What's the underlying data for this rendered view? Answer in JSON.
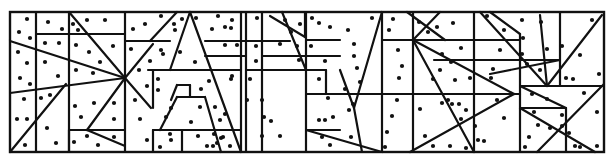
{
  "diagram": {
    "type": "polygon-dot-puzzle",
    "width": 614,
    "height": 162,
    "frame": {
      "x": 10,
      "y": 12,
      "w": 594,
      "h": 140
    },
    "colors": {
      "line": "#111111",
      "dot": "#111111",
      "background": "#ffffff"
    },
    "lines": [
      [
        36,
        12,
        36,
        152
      ],
      [
        69,
        12,
        69,
        152
      ],
      [
        125,
        12,
        125,
        152
      ],
      [
        10,
        40,
        10,
        40
      ],
      [
        36,
        34,
        125,
        34
      ],
      [
        10,
        41,
        125,
        78
      ],
      [
        10,
        93,
        125,
        78
      ],
      [
        10,
        152,
        66,
        84
      ],
      [
        69,
        130,
        125,
        130
      ],
      [
        87,
        130,
        125,
        146
      ],
      [
        87,
        130,
        125,
        78
      ],
      [
        69,
        12,
        125,
        78
      ],
      [
        125,
        78,
        153,
        44
      ],
      [
        125,
        78,
        151,
        108
      ],
      [
        125,
        41,
        170,
        41
      ],
      [
        150,
        41,
        177,
        12
      ],
      [
        148,
        70,
        205,
        70
      ],
      [
        153,
        70,
        153,
        108
      ],
      [
        170,
        70,
        190,
        12
      ],
      [
        190,
        12,
        241,
        152
      ],
      [
        171,
        100,
        177,
        85
      ],
      [
        177,
        85,
        190,
        85
      ],
      [
        190,
        85,
        190,
        97
      ],
      [
        177,
        97,
        205,
        97
      ],
      [
        160,
        130,
        177,
        97
      ],
      [
        205,
        97,
        221,
        152
      ],
      [
        153,
        130,
        241,
        130
      ],
      [
        153,
        130,
        153,
        152
      ],
      [
        182,
        130,
        182,
        152
      ],
      [
        69,
        130,
        69,
        152
      ],
      [
        241,
        12,
        241,
        152
      ],
      [
        246,
        12,
        246,
        152
      ],
      [
        205,
        41,
        290,
        41
      ],
      [
        205,
        56,
        246,
        56
      ],
      [
        205,
        70,
        241,
        70
      ],
      [
        246,
        70,
        290,
        70
      ],
      [
        262,
        12,
        262,
        152
      ],
      [
        262,
        56,
        306,
        56
      ],
      [
        270,
        16,
        305,
        37
      ],
      [
        305,
        37,
        305,
        12
      ],
      [
        282,
        12,
        306,
        70
      ],
      [
        306,
        40,
        340,
        40
      ],
      [
        306,
        56,
        340,
        56
      ],
      [
        306,
        12,
        306,
        152
      ],
      [
        290,
        70,
        326,
        70
      ],
      [
        326,
        70,
        326,
        94
      ],
      [
        306,
        94,
        382,
        94
      ],
      [
        340,
        70,
        354,
        108
      ],
      [
        354,
        108,
        382,
        12
      ],
      [
        306,
        130,
        340,
        130
      ],
      [
        306,
        130,
        382,
        152
      ],
      [
        354,
        108,
        362,
        152
      ],
      [
        340,
        152,
        340,
        152
      ],
      [
        382,
        12,
        382,
        152
      ],
      [
        382,
        40,
        413,
        40
      ],
      [
        382,
        94,
        413,
        94
      ],
      [
        407,
        12,
        445,
        40
      ],
      [
        413,
        12,
        413,
        152
      ],
      [
        413,
        40,
        520,
        40
      ],
      [
        440,
        12,
        413,
        40
      ],
      [
        413,
        40,
        474,
        152
      ],
      [
        413,
        40,
        514,
        94
      ],
      [
        434,
        60,
        520,
        60
      ],
      [
        413,
        94,
        520,
        94
      ],
      [
        514,
        94,
        520,
        94
      ],
      [
        410,
        152,
        514,
        94
      ],
      [
        474,
        12,
        474,
        152
      ],
      [
        490,
        12,
        520,
        34
      ],
      [
        520,
        34,
        520,
        152
      ],
      [
        480,
        12,
        547,
        86
      ],
      [
        540,
        15,
        547,
        86
      ],
      [
        560,
        12,
        560,
        86
      ],
      [
        547,
        86,
        602,
        15
      ],
      [
        520,
        60,
        560,
        60
      ],
      [
        490,
        74,
        560,
        60
      ],
      [
        520,
        86,
        604,
        86
      ],
      [
        520,
        86,
        566,
        108
      ],
      [
        520,
        108,
        566,
        108
      ],
      [
        520,
        108,
        595,
        152
      ],
      [
        566,
        108,
        566,
        152
      ],
      [
        537,
        152,
        604,
        84
      ]
    ],
    "dots": [
      [
        27,
        19
      ],
      [
        19,
        32
      ],
      [
        30,
        38
      ],
      [
        48,
        22
      ],
      [
        62,
        29
      ],
      [
        73,
        24
      ],
      [
        78,
        30
      ],
      [
        87,
        20
      ],
      [
        105,
        20
      ],
      [
        18,
        52
      ],
      [
        27,
        63
      ],
      [
        45,
        43
      ],
      [
        59,
        43
      ],
      [
        45,
        62
      ],
      [
        76,
        45
      ],
      [
        89,
        52
      ],
      [
        113,
        46
      ],
      [
        100,
        62
      ],
      [
        20,
        78
      ],
      [
        30,
        84
      ],
      [
        58,
        76
      ],
      [
        76,
        70
      ],
      [
        93,
        73
      ],
      [
        24,
        99
      ],
      [
        41,
        98
      ],
      [
        50,
        95
      ],
      [
        17,
        119
      ],
      [
        27,
        119
      ],
      [
        47,
        128
      ],
      [
        75,
        106
      ],
      [
        94,
        103
      ],
      [
        114,
        103
      ],
      [
        81,
        117
      ],
      [
        114,
        119
      ],
      [
        74,
        142
      ],
      [
        56,
        143
      ],
      [
        25,
        145
      ],
      [
        87,
        136
      ],
      [
        98,
        145
      ],
      [
        114,
        137
      ],
      [
        133,
        29
      ],
      [
        145,
        24
      ],
      [
        161,
        16
      ],
      [
        174,
        24
      ],
      [
        182,
        19
      ],
      [
        175,
        30
      ],
      [
        131,
        49
      ],
      [
        161,
        50
      ],
      [
        196,
        18
      ],
      [
        212,
        29
      ],
      [
        225,
        27
      ],
      [
        232,
        20
      ],
      [
        195,
        62
      ],
      [
        150,
        61
      ],
      [
        163,
        54
      ],
      [
        180,
        52
      ],
      [
        139,
        70
      ],
      [
        147,
        86
      ],
      [
        158,
        90
      ],
      [
        158,
        79
      ],
      [
        135,
        100
      ],
      [
        171,
        108
      ],
      [
        140,
        119
      ],
      [
        166,
        117
      ],
      [
        171,
        140
      ],
      [
        170,
        134
      ],
      [
        147,
        140
      ],
      [
        160,
        147
      ],
      [
        213,
        146
      ],
      [
        198,
        136
      ],
      [
        207,
        146
      ],
      [
        200,
        107
      ],
      [
        201,
        89
      ],
      [
        209,
        81
      ],
      [
        215,
        107
      ],
      [
        220,
        120
      ],
      [
        191,
        122
      ],
      [
        221,
        138
      ],
      [
        217,
        143
      ],
      [
        230,
        146
      ],
      [
        223,
        137
      ],
      [
        225,
        114
      ],
      [
        214,
        134
      ],
      [
        218,
        16
      ],
      [
        231,
        28
      ],
      [
        225,
        45
      ],
      [
        237,
        45
      ],
      [
        256,
        46
      ],
      [
        257,
        18
      ],
      [
        250,
        79
      ],
      [
        256,
        61
      ],
      [
        232,
        76
      ],
      [
        231,
        79
      ],
      [
        247,
        100
      ],
      [
        262,
        100
      ],
      [
        264,
        117
      ],
      [
        262,
        136
      ],
      [
        280,
        136
      ],
      [
        271,
        121
      ],
      [
        285,
        20
      ],
      [
        300,
        24
      ],
      [
        291,
        32
      ],
      [
        297,
        46
      ],
      [
        280,
        44
      ],
      [
        299,
        60
      ],
      [
        312,
        18
      ],
      [
        311,
        46
      ],
      [
        325,
        61
      ],
      [
        319,
        79
      ],
      [
        328,
        98
      ],
      [
        319,
        120
      ],
      [
        325,
        120
      ],
      [
        333,
        117
      ],
      [
        322,
        137
      ],
      [
        330,
        145
      ],
      [
        351,
        137
      ],
      [
        349,
        110
      ],
      [
        353,
        104
      ],
      [
        345,
        89
      ],
      [
        360,
        82
      ],
      [
        357,
        68
      ],
      [
        354,
        56
      ],
      [
        354,
        44
      ],
      [
        348,
        30
      ],
      [
        330,
        27
      ],
      [
        319,
        23
      ],
      [
        372,
        18
      ],
      [
        393,
        19
      ],
      [
        389,
        30
      ],
      [
        398,
        50
      ],
      [
        402,
        66
      ],
      [
        399,
        78
      ],
      [
        397,
        100
      ],
      [
        392,
        116
      ],
      [
        387,
        132
      ],
      [
        385,
        147
      ],
      [
        419,
        22
      ],
      [
        428,
        32
      ],
      [
        437,
        27
      ],
      [
        453,
        23
      ],
      [
        461,
        48
      ],
      [
        442,
        54
      ],
      [
        451,
        62
      ],
      [
        440,
        70
      ],
      [
        455,
        80
      ],
      [
        470,
        78
      ],
      [
        433,
        79
      ],
      [
        448,
        100
      ],
      [
        452,
        104
      ],
      [
        459,
        104
      ],
      [
        466,
        110
      ],
      [
        461,
        119
      ],
      [
        475,
        126
      ],
      [
        478,
        140
      ],
      [
        466,
        148
      ],
      [
        450,
        146
      ],
      [
        433,
        146
      ],
      [
        425,
        136
      ],
      [
        420,
        109
      ],
      [
        442,
        103
      ],
      [
        487,
        16
      ],
      [
        504,
        30
      ],
      [
        500,
        50
      ],
      [
        493,
        69
      ],
      [
        491,
        78
      ],
      [
        497,
        100
      ],
      [
        504,
        118
      ],
      [
        484,
        141
      ],
      [
        522,
        20
      ],
      [
        523,
        38
      ],
      [
        522,
        54
      ],
      [
        527,
        64
      ],
      [
        540,
        70
      ],
      [
        541,
        22
      ],
      [
        547,
        49
      ],
      [
        562,
        46
      ],
      [
        566,
        78
      ],
      [
        580,
        55
      ],
      [
        592,
        20
      ],
      [
        599,
        74
      ],
      [
        573,
        79
      ],
      [
        584,
        93
      ],
      [
        597,
        112
      ],
      [
        597,
        146
      ],
      [
        532,
        94
      ],
      [
        547,
        99
      ],
      [
        534,
        112
      ],
      [
        538,
        125
      ],
      [
        529,
        137
      ],
      [
        550,
        128
      ],
      [
        562,
        115
      ],
      [
        562,
        126
      ],
      [
        569,
        133
      ],
      [
        575,
        146
      ],
      [
        580,
        147
      ],
      [
        525,
        147
      ]
    ]
  }
}
